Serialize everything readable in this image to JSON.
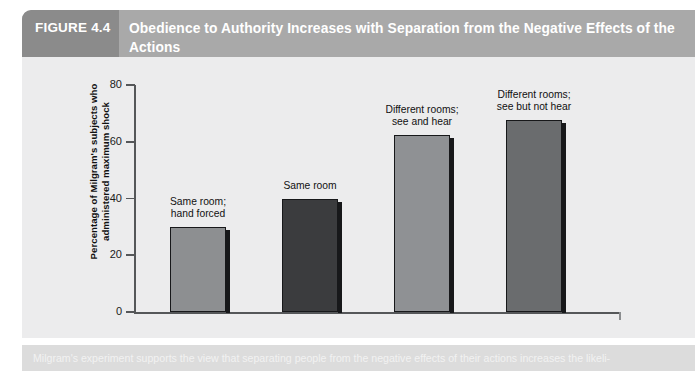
{
  "figure": {
    "number_label": "FIGURE 4.4",
    "title": "Obedience to Authority Increases with Separation from the Negative Effects of the Actions",
    "caption": "Milgram's experiment supports the view that separating people from the negative effects of their actions increases the likeli-"
  },
  "colors": {
    "figure_number_band": "#8b8b8b",
    "title_band": "#a9a9a9",
    "panel_background": "#ececed",
    "caption_band": "#dcdcdc",
    "axis": "#555759",
    "bar_outline": "#17181a",
    "bar_light_gray": "#8d8f91",
    "bar_dark": "#3b3c3e",
    "bar_medium_gray": "#8f9194",
    "bar_medium_dark": "#6a6c6e"
  },
  "chart_data": {
    "type": "bar",
    "title": "Obedience to Authority Increases with Separation from the Negative Effects of the Actions",
    "xlabel": "",
    "ylabel": "Percentage of Milgram's subjects who administered maximum shock",
    "ylim": [
      0,
      80
    ],
    "yticks": [
      0,
      20,
      40,
      60,
      80
    ],
    "ytick_labels": [
      "0",
      "20",
      "40",
      "60",
      "80"
    ],
    "grid": false,
    "legend": "none",
    "categories": [
      "Same room;\nhand forced",
      "Same room",
      "Different rooms;\nsee and hear",
      "Different rooms;\nsee but not hear"
    ],
    "values": [
      30,
      40,
      62.5,
      67.5
    ],
    "bar_colors": [
      "#8d8f91",
      "#3b3c3e",
      "#8f9194",
      "#6a6c6e"
    ]
  },
  "y_axis_title_line1": "Percentage of Milgram's subjects who",
  "y_axis_title_line2": "administered maximum shock"
}
